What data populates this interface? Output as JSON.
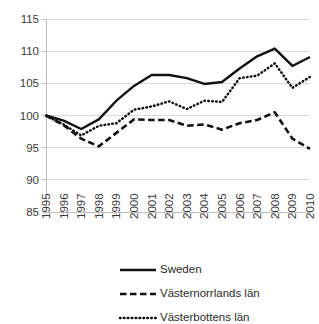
{
  "chart_data": {
    "type": "line",
    "title": "",
    "xlabel": "",
    "ylabel": "",
    "ylim": [
      85,
      115
    ],
    "ytick_step": 5,
    "yticks": [
      85,
      90,
      95,
      100,
      105,
      110,
      115
    ],
    "grid": true,
    "legend_position": "bottom",
    "categories": [
      "1995",
      "1996",
      "1997",
      "1998",
      "1999",
      "2000",
      "2001",
      "2002",
      "2003",
      "2004",
      "2005",
      "2006",
      "2007",
      "2008",
      "2009",
      "2010"
    ],
    "series": [
      {
        "name": "Sweden",
        "style": "solid",
        "color": "#111111",
        "values": [
          100.0,
          99.2,
          97.9,
          99.4,
          102.3,
          104.6,
          106.3,
          106.3,
          105.8,
          104.9,
          105.2,
          107.3,
          109.2,
          110.4,
          107.7,
          109.1
        ]
      },
      {
        "name": "Västernorrlands län",
        "style": "dashed",
        "color": "#111111",
        "values": [
          100.0,
          98.5,
          96.4,
          95.2,
          97.3,
          99.4,
          99.3,
          99.3,
          98.4,
          98.6,
          97.8,
          98.8,
          99.3,
          100.5,
          96.4,
          94.8
        ]
      },
      {
        "name": "Västerbottens län",
        "style": "dotted",
        "color": "#111111",
        "values": [
          100.0,
          98.6,
          96.9,
          98.4,
          98.8,
          100.9,
          101.4,
          102.2,
          101.0,
          102.3,
          102.1,
          105.8,
          106.2,
          108.1,
          104.3,
          106.0
        ]
      }
    ]
  },
  "legend": {
    "entries": [
      {
        "label": "Sweden"
      },
      {
        "label": "Västernorrlands län"
      },
      {
        "label": "Västerbottens län"
      }
    ]
  }
}
